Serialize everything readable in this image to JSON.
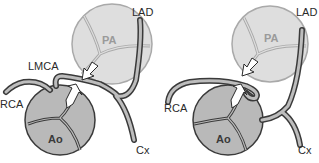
{
  "colors": {
    "pa_fill": "#dedede",
    "pa_stroke": "#a9a9a9",
    "ao_fill": "#b9b9b9",
    "ao_stroke": "#3a3a3a",
    "vessel_outline": "#3a3a3a",
    "vessel_fill": "#bdbdbd",
    "arrow_fill": "#ffffff",
    "arrow_stroke": "#2a2a2a",
    "pa_text": "#9a9a9a",
    "ao_text": "#3a3a3a"
  },
  "panels": [
    {
      "id": "left",
      "labels": {
        "lad": "LAD",
        "lmca": "LMCA",
        "rca": "RCA",
        "pa": "PA",
        "ao": "Ao",
        "cx": "Cx"
      }
    },
    {
      "id": "right",
      "labels": {
        "lad": "LAD",
        "rca": "RCA",
        "pa": "PA",
        "ao": "Ao",
        "cx": "Cx"
      }
    }
  ]
}
